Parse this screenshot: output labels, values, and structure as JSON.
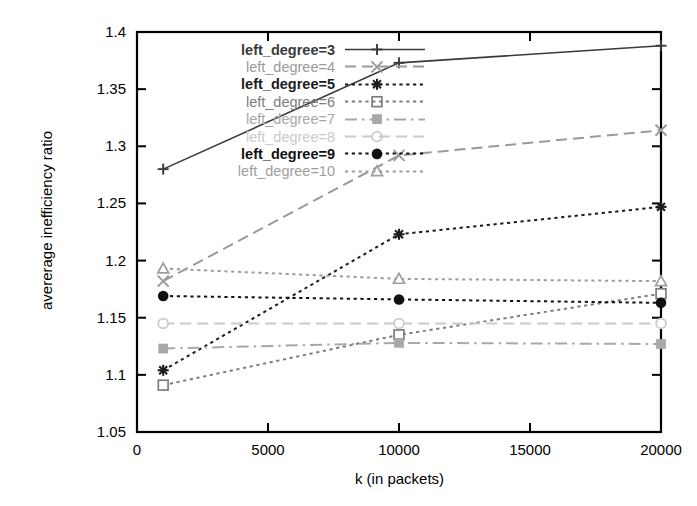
{
  "chart_data": {
    "type": "line",
    "title": "",
    "xlabel": "k (in packets)",
    "ylabel": "avererage inefficiency ratio",
    "xlim": [
      0,
      20000
    ],
    "ylim": [
      1.05,
      1.4
    ],
    "xticks": [
      "0",
      "5000",
      "10000",
      "15000",
      "20000"
    ],
    "xtick_values": [
      0,
      5000,
      10000,
      15000,
      20000
    ],
    "yticks": [
      "1.05",
      "1.1",
      "1.15",
      "1.2",
      "1.25",
      "1.3",
      "1.35",
      "1.4"
    ],
    "ytick_values": [
      1.05,
      1.1,
      1.15,
      1.2,
      1.25,
      1.3,
      1.35,
      1.4
    ],
    "grid": false,
    "legend_position": "top-left",
    "x": [
      1000,
      10000,
      20000
    ],
    "series": [
      {
        "name": "left_degree=3",
        "marker": "plus",
        "dash": "solid",
        "color": "#3a3a3a",
        "values": [
          1.28,
          1.373,
          1.388
        ]
      },
      {
        "name": "left_degree=4",
        "marker": "cross",
        "dash": "dashed",
        "color": "#9a9a9a",
        "values": [
          1.182,
          1.292,
          1.314
        ]
      },
      {
        "name": "left_degree=5",
        "marker": "star",
        "dash": "dotted",
        "color": "#1c1c1c",
        "values": [
          1.104,
          1.223,
          1.247
        ]
      },
      {
        "name": "left_degree=6",
        "marker": "open-square",
        "dash": "dotted",
        "color": "#7d7d7d",
        "values": [
          1.091,
          1.135,
          1.171
        ]
      },
      {
        "name": "left_degree=7",
        "marker": "filled-square",
        "dash": "dashdot",
        "color": "#a8a8a8",
        "values": [
          1.123,
          1.128,
          1.127
        ]
      },
      {
        "name": "left_degree=8",
        "marker": "open-circle",
        "dash": "dashed",
        "color": "#cacaca",
        "values": [
          1.145,
          1.145,
          1.145
        ]
      },
      {
        "name": "left_degree=9",
        "marker": "filled-circle",
        "dash": "dotted",
        "color": "#111111",
        "values": [
          1.169,
          1.166,
          1.163
        ]
      },
      {
        "name": "left_degree=10",
        "marker": "open-triangle",
        "dash": "dotted",
        "color": "#9e9e9e",
        "values": [
          1.193,
          1.184,
          1.182
        ]
      }
    ]
  },
  "axes": {
    "ylabel": "avererage inefficiency ratio",
    "xlabel": "k (in packets)"
  },
  "legend": {
    "entries": [
      {
        "label": "left_degree=3"
      },
      {
        "label": "left_degree=4"
      },
      {
        "label": "left_degree=5"
      },
      {
        "label": "left_degree=6"
      },
      {
        "label": "left_degree=7"
      },
      {
        "label": "left_degree=8"
      },
      {
        "label": "left_degree=9"
      },
      {
        "label": "left_degree=10"
      }
    ]
  }
}
